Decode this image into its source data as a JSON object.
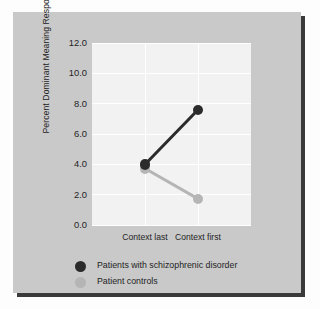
{
  "figure": {
    "panel_bg": "#c9c9c9",
    "plot_bg": "#f2f2f2",
    "grid_color": "#ffffff",
    "text_color": "#242424"
  },
  "chart_data": {
    "type": "line",
    "title": "",
    "subtitle": "",
    "xlabel": "",
    "ylabel": "Percent Dominant Meaning Responses",
    "categories": [
      "Context last",
      "Context first"
    ],
    "xtick_labels": [
      "Context last",
      "Context first"
    ],
    "ytick_labels": [
      "0.0",
      "2.0",
      "4.0",
      "6.0",
      "8.0",
      "10.0",
      "12.0"
    ],
    "ytick_values": [
      0.0,
      2.0,
      4.0,
      6.0,
      8.0,
      10.0,
      12.0
    ],
    "ylim": [
      0.0,
      12.0
    ],
    "grid": "horizontal-and-vertical",
    "legend_position": "below-axes-left",
    "series": [
      {
        "name": "Patients with schizophrenic disorder",
        "color": "#2b2b2b",
        "marker": "circle",
        "values": [
          4.0,
          7.6
        ]
      },
      {
        "name": "Patient controls",
        "color": "#b5b5b5",
        "marker": "circle",
        "values": [
          3.7,
          1.7
        ]
      }
    ]
  },
  "legend": {
    "items": [
      {
        "label": "Patients with schizophrenic disorder",
        "color": "#2b2b2b"
      },
      {
        "label": "Patient controls",
        "color": "#b5b5b5"
      }
    ]
  }
}
